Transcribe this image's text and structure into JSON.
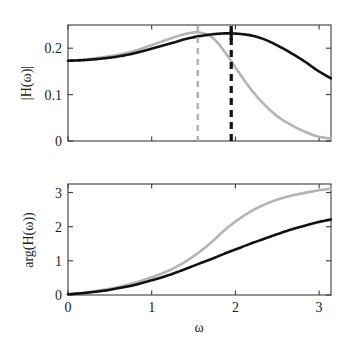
{
  "figure": {
    "caption": "",
    "background_color": "#ffffff",
    "colors": {
      "series_black": "#111111",
      "series_gray": "#b4b4b4",
      "axis": "#3b3b3b"
    }
  },
  "chart_data": [
    {
      "type": "line",
      "id": "magnitude-plot",
      "title": "",
      "xlabel": "",
      "ylabel": "|H(ω)|",
      "xlim": [
        0,
        3.1416
      ],
      "ylim": [
        0,
        0.25
      ],
      "xticks": [
        0,
        1,
        2,
        3
      ],
      "xticklabels": [
        "",
        "",
        "",
        ""
      ],
      "yticks": [
        0,
        0.1,
        0.2
      ],
      "yticklabels": [
        "0",
        "0.1",
        "0.2"
      ],
      "grid": false,
      "legend": "none",
      "annotations": [
        {
          "name": "gray-peak-marker",
          "type": "vline",
          "x": 1.55,
          "color": "#b4b4b4",
          "style": "dashed"
        },
        {
          "name": "black-peak-marker",
          "type": "vline",
          "x": 1.95,
          "color": "#111111",
          "style": "dashed"
        }
      ],
      "series": [
        {
          "name": "black-magnitude",
          "color": "#111111",
          "x": [
            0.0,
            0.16,
            0.31,
            0.47,
            0.63,
            0.79,
            0.94,
            1.1,
            1.26,
            1.41,
            1.57,
            1.73,
            1.88,
            2.04,
            2.2,
            2.36,
            2.51,
            2.67,
            2.83,
            2.98,
            3.14
          ],
          "y": [
            0.173,
            0.174,
            0.176,
            0.179,
            0.183,
            0.189,
            0.196,
            0.204,
            0.212,
            0.22,
            0.226,
            0.23,
            0.232,
            0.231,
            0.227,
            0.218,
            0.205,
            0.189,
            0.171,
            0.152,
            0.135
          ]
        },
        {
          "name": "gray-magnitude",
          "color": "#b4b4b4",
          "x": [
            0.0,
            0.16,
            0.31,
            0.47,
            0.63,
            0.79,
            0.94,
            1.1,
            1.26,
            1.41,
            1.57,
            1.73,
            1.88,
            2.04,
            2.2,
            2.36,
            2.51,
            2.67,
            2.83,
            2.98,
            3.14
          ],
          "y": [
            0.173,
            0.175,
            0.178,
            0.182,
            0.187,
            0.194,
            0.203,
            0.213,
            0.223,
            0.231,
            0.234,
            0.222,
            0.19,
            0.148,
            0.108,
            0.076,
            0.052,
            0.034,
            0.02,
            0.01,
            0.005
          ]
        }
      ]
    },
    {
      "type": "line",
      "id": "phase-plot",
      "title": "",
      "xlabel": "ω",
      "ylabel": "arg(H(ω))",
      "xlim": [
        0,
        3.1416
      ],
      "ylim": [
        0,
        3.25
      ],
      "xticks": [
        0,
        1,
        2,
        3
      ],
      "xticklabels": [
        "0",
        "1",
        "2",
        "3"
      ],
      "yticks": [
        0,
        1,
        2,
        3
      ],
      "yticklabels": [
        "0",
        "1",
        "2",
        "3"
      ],
      "grid": false,
      "legend": "none",
      "annotations": [],
      "series": [
        {
          "name": "black-phase",
          "color": "#111111",
          "x": [
            0.0,
            0.16,
            0.31,
            0.47,
            0.63,
            0.79,
            0.94,
            1.1,
            1.26,
            1.41,
            1.57,
            1.73,
            1.88,
            2.04,
            2.2,
            2.36,
            2.51,
            2.67,
            2.83,
            2.98,
            3.14
          ],
          "y": [
            0.02,
            0.05,
            0.09,
            0.14,
            0.21,
            0.29,
            0.39,
            0.5,
            0.63,
            0.77,
            0.92,
            1.07,
            1.22,
            1.37,
            1.52,
            1.66,
            1.79,
            1.92,
            2.03,
            2.13,
            2.21
          ]
        },
        {
          "name": "gray-phase",
          "color": "#b4b4b4",
          "x": [
            0.0,
            0.16,
            0.31,
            0.47,
            0.63,
            0.79,
            0.94,
            1.1,
            1.26,
            1.41,
            1.57,
            1.73,
            1.88,
            2.04,
            2.2,
            2.36,
            2.51,
            2.67,
            2.83,
            2.98,
            3.14
          ],
          "y": [
            0.02,
            0.06,
            0.11,
            0.17,
            0.25,
            0.35,
            0.47,
            0.61,
            0.78,
            0.99,
            1.26,
            1.58,
            1.92,
            2.22,
            2.47,
            2.66,
            2.8,
            2.91,
            2.99,
            3.06,
            3.11
          ]
        }
      ]
    }
  ]
}
